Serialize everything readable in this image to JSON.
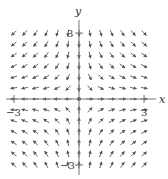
{
  "chart_data": {
    "type": "vector_field",
    "field": {
      "fx": "x",
      "fy": "-y"
    },
    "title": "",
    "xlabel": "x",
    "ylabel": "y",
    "xlim": [
      -3.4,
      3.4
    ],
    "ylim": [
      -3.4,
      3.4
    ],
    "tick_labels": {
      "x": [
        "-3",
        "3"
      ],
      "y": [
        "3",
        "-3"
      ]
    },
    "grid_step": 0.5,
    "grid_range": [
      -3,
      3
    ],
    "arrow_color": "#555555",
    "axis_color": "#777777"
  },
  "axes": {
    "x_label": "x",
    "y_label": "y",
    "x_tick_neg": "−3",
    "x_tick_pos": "3",
    "y_tick_pos": "3",
    "y_tick_neg": "−3"
  }
}
